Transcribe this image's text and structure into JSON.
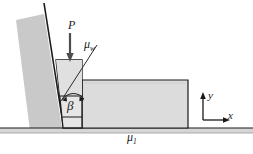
{
  "figure": {
    "title": "",
    "labels": {
      "load": "P",
      "wall_friction_mu": "μ",
      "wall_friction_sub": "w",
      "angle": "β",
      "ground_friction_mu": "μ",
      "ground_friction_sub": "1",
      "axis_y": "y",
      "axis_x": "x"
    },
    "colors": {
      "stroke": "#1a1a1a",
      "wall_fill": "#c9c9c9",
      "wedge_fill": "#e3e3e3",
      "block_fill": "#dcdcdc",
      "ground_fill": "#d0d0d0",
      "background": "#ffffff"
    },
    "elements": {
      "inclined_wall": "inclined-wall",
      "wedge": "wedge-block",
      "large_block": "large-block",
      "ground": "ground-surface",
      "load_arrow": "load-arrow",
      "mu_w_leader": "mu-w-leader-line",
      "angle_arc": "angle-arc",
      "axes": "coordinate-axes"
    }
  }
}
